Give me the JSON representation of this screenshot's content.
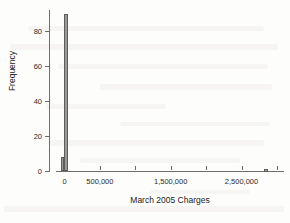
{
  "chart_data": {
    "type": "bar",
    "title": "",
    "subtitle": "",
    "xlabel": "March 2005 Charges",
    "ylabel": "Frequency",
    "xlim": [
      -120000,
      3100000
    ],
    "ylim": [
      0,
      92
    ],
    "grid": false,
    "legend": null,
    "bin_width": 55000,
    "x_ticks": [
      {
        "value": 0,
        "label": "0",
        "labeled": true
      },
      {
        "value": 500000,
        "label": "500,000",
        "labeled": true
      },
      {
        "value": 1000000,
        "label": "",
        "labeled": false
      },
      {
        "value": 1500000,
        "label": "1,500,000",
        "labeled": true
      },
      {
        "value": 2000000,
        "label": "",
        "labeled": false
      },
      {
        "value": 2500000,
        "label": "2,500,000",
        "labeled": true
      },
      {
        "value": 3000000,
        "label": "",
        "labeled": false
      }
    ],
    "y_ticks": [
      {
        "value": 0,
        "label": "0"
      },
      {
        "value": 20,
        "label": "20"
      },
      {
        "value": 40,
        "label": "40"
      },
      {
        "value": 60,
        "label": "60"
      },
      {
        "value": 80,
        "label": "80"
      }
    ],
    "bars": [
      {
        "name": "bin-negative",
        "x_left": -55000,
        "x_right": 0,
        "center": -27500,
        "value": 8
      },
      {
        "name": "bin-zero",
        "x_left": 0,
        "x_right": 55000,
        "center": 27500,
        "value": 90
      },
      {
        "name": "bin-outlier",
        "x_left": 2820000,
        "x_right": 2875000,
        "center": 2847500,
        "value": 1
      }
    ],
    "categories": [
      "-27,500",
      "27,500",
      "2,847,500"
    ],
    "values": [
      8,
      90,
      1
    ],
    "colors": {
      "bar_fill": "#9a9a9a",
      "bar_stroke": "#5d5d5d",
      "axis": "#6e6e6e",
      "text": "#2a2a2a",
      "background": "#fdfdfc"
    }
  }
}
